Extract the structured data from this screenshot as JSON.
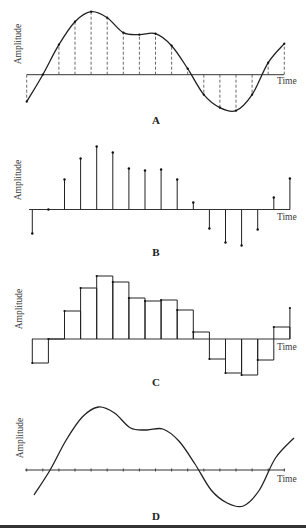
{
  "figure": {
    "panels": [
      {
        "id": "A",
        "letter": "A",
        "ylabel": "Amplitude",
        "xlabel": "Time",
        "description": "Continuous waveform with sampled points marked by dashed vertical lines"
      },
      {
        "id": "B",
        "letter": "B",
        "ylabel": "Amplitude",
        "xlabel": "Time",
        "description": "Discrete samples shown as stems with dots"
      },
      {
        "id": "C",
        "letter": "C",
        "ylabel": "Amplitude",
        "xlabel": "Time",
        "description": "Sample-and-hold staircase reconstruction"
      },
      {
        "id": "D",
        "letter": "D",
        "ylabel": "Amplitude",
        "xlabel": "Time",
        "description": "Reconstructed smooth waveform with tick marks on time axis"
      }
    ]
  },
  "chart_data": [
    {
      "panel": "A",
      "type": "line",
      "title": "A",
      "xlabel": "Time",
      "ylabel": "Amplitude",
      "sample_index": [
        0,
        1,
        2,
        3,
        4,
        5,
        6,
        7,
        8,
        9,
        10,
        11,
        12,
        13,
        14,
        15,
        16
      ],
      "sample_amplitude": [
        -27,
        0,
        30,
        53,
        63,
        57,
        42,
        40,
        41,
        29,
        6,
        -20,
        -33,
        -36,
        -20,
        12,
        31
      ],
      "style": "continuous curve with dashed sample lines"
    },
    {
      "panel": "B",
      "type": "stem",
      "title": "B",
      "xlabel": "Time",
      "ylabel": "Amplitude",
      "sample_index": [
        0,
        1,
        2,
        3,
        4,
        5,
        6,
        7,
        8,
        9,
        10,
        11,
        12,
        13,
        14,
        15,
        16
      ],
      "sample_amplitude": [
        -24,
        0,
        30,
        51,
        63,
        57,
        41,
        39,
        40,
        30,
        7,
        -19,
        -33,
        -36,
        -20,
        12,
        31
      ]
    },
    {
      "panel": "C",
      "type": "step",
      "title": "C",
      "xlabel": "Time",
      "ylabel": "Amplitude",
      "sample_index": [
        0,
        1,
        2,
        3,
        4,
        5,
        6,
        7,
        8,
        9,
        10,
        11,
        12,
        13,
        14,
        15,
        16
      ],
      "sample_amplitude": [
        -24,
        0,
        28,
        51,
        63,
        57,
        41,
        38,
        39,
        29,
        7,
        -20,
        -34,
        -36,
        -21,
        12,
        31
      ]
    },
    {
      "panel": "D",
      "type": "line",
      "title": "D",
      "xlabel": "Time",
      "ylabel": "Amplitude",
      "style": "smooth reconstructed curve, time axis with tick marks at sample instants",
      "tick_count": 17
    }
  ],
  "geometry": {
    "x0": 26.7,
    "dx": 16.1,
    "axes": {
      "A": {
        "top": 0,
        "axis_y": 74.7,
        "x_start": 26.7,
        "x_end": 284
      },
      "B": {
        "top": 130,
        "axis_y": 209.5,
        "x_start": 29,
        "x_end": 290
      },
      "C": {
        "top": 260,
        "axis_y": 339,
        "x_start": 32,
        "x_end": 290
      },
      "D": {
        "top": 395,
        "axis_y": 470,
        "x_start": 25,
        "x_end": 285
      }
    }
  }
}
